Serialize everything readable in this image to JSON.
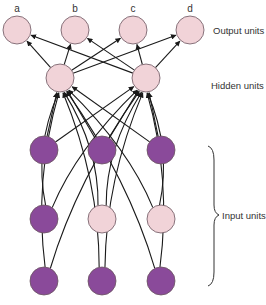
{
  "diagram": {
    "colors": {
      "unit_light": "#f1d3d8",
      "unit_active": "#8a4a9a",
      "unit_stroke": "#6b5560",
      "edge": "#1a1a1a"
    },
    "layer_labels": {
      "output": "Output units",
      "hidden": "Hidden units",
      "input": "Input units"
    },
    "output_units": [
      {
        "id": "a",
        "label": "a",
        "x": 17,
        "y": 30
      },
      {
        "id": "b",
        "label": "b",
        "x": 75,
        "y": 30
      },
      {
        "id": "c",
        "label": "c",
        "x": 133,
        "y": 30
      },
      {
        "id": "d",
        "label": "d",
        "x": 190,
        "y": 30
      }
    ],
    "hidden_units": [
      {
        "id": "h1",
        "x": 60,
        "y": 78
      },
      {
        "id": "h2",
        "x": 146,
        "y": 78
      }
    ],
    "input_units": [
      {
        "id": "i11",
        "x": 44,
        "y": 150,
        "active": true
      },
      {
        "id": "i12",
        "x": 102,
        "y": 150,
        "active": true
      },
      {
        "id": "i13",
        "x": 161,
        "y": 150,
        "active": true
      },
      {
        "id": "i21",
        "x": 44,
        "y": 219,
        "active": true
      },
      {
        "id": "i22",
        "x": 102,
        "y": 219,
        "active": false
      },
      {
        "id": "i23",
        "x": 161,
        "y": 219,
        "active": false
      },
      {
        "id": "i31",
        "x": 44,
        "y": 281,
        "active": true
      },
      {
        "id": "i32",
        "x": 102,
        "y": 281,
        "active": true
      },
      {
        "id": "i33",
        "x": 161,
        "y": 281,
        "active": true
      }
    ],
    "unit_radius": 14,
    "connections": "fully connected: every input unit -> both hidden units; both hidden units -> every output unit"
  }
}
